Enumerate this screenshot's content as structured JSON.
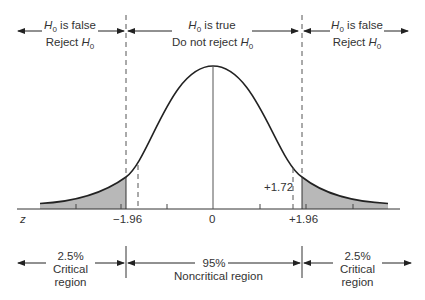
{
  "top_regions": {
    "left": {
      "line1_suffix": " is false",
      "line2_prefix": "Reject "
    },
    "center": {
      "line1_suffix": " is true",
      "line2_prefix": "Do not reject "
    },
    "right": {
      "line1_suffix": " is false",
      "line2_prefix": "Reject "
    },
    "h_symbol": "H",
    "h_subscript": "0"
  },
  "axis": {
    "variable": "z",
    "labels": {
      "left_critical": "−1.96",
      "center": "0",
      "right_critical": "+1.96"
    },
    "test_statistic": "+1.72"
  },
  "bottom_regions": {
    "left": {
      "percent": "2.5%",
      "line2": "Critical",
      "line3": "region"
    },
    "center": {
      "percent": "95%",
      "line2": "Noncritical region"
    },
    "right": {
      "percent": "2.5%",
      "line2": "Critical",
      "line3": "region"
    }
  },
  "colors": {
    "shade": "#b8b8b8",
    "line": "#222222",
    "dash": "#555555"
  }
}
